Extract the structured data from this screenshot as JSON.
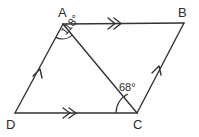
{
  "diagram": {
    "shape_type": "parallelogram",
    "stroke_color": "#333333",
    "background_color": "#ffffff",
    "vertices": [
      {
        "name": "A",
        "label": "A",
        "x": 63,
        "y": 24
      },
      {
        "name": "B",
        "label": "B",
        "x": 184,
        "y": 23
      },
      {
        "name": "C",
        "label": "C",
        "x": 137,
        "y": 113
      },
      {
        "name": "D",
        "label": "D",
        "x": 15,
        "y": 113
      }
    ],
    "sides": [
      {
        "name": "side-AB",
        "from": "A",
        "to": "B",
        "marker": "double-chevron"
      },
      {
        "name": "side-BC",
        "from": "B",
        "to": "C",
        "marker": "single-chevron"
      },
      {
        "name": "side-DC",
        "from": "D",
        "to": "C",
        "marker": "double-chevron"
      },
      {
        "name": "side-DA",
        "from": "D",
        "to": "A",
        "marker": "single-chevron"
      }
    ],
    "diagonal": {
      "name": "diagonal-AC",
      "from": "A",
      "to": "C",
      "marker": "none"
    },
    "angles": [
      {
        "name": "angle-at-A",
        "vertex": "A",
        "value": 118,
        "label": "118°",
        "rotation_deg": -50,
        "between": [
          "A-D",
          "A-C"
        ]
      },
      {
        "name": "angle-at-C",
        "vertex": "C",
        "value": 68,
        "label": "68°",
        "rotation_deg": 0,
        "between": [
          "C-D",
          "C-B"
        ]
      }
    ]
  }
}
